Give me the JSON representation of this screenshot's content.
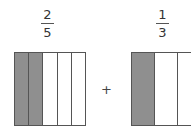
{
  "diagram": {
    "left": {
      "fraction": {
        "numerator": "2",
        "denominator": "5"
      },
      "parts": 5,
      "shaded": 2
    },
    "operator": "+",
    "right": {
      "fraction": {
        "numerator": "1",
        "denominator": "3"
      },
      "parts": 3,
      "shaded": 1
    },
    "colors": {
      "shaded": "#8f8f8f",
      "unshaded": "#ffffff",
      "stroke": "#555555"
    }
  }
}
